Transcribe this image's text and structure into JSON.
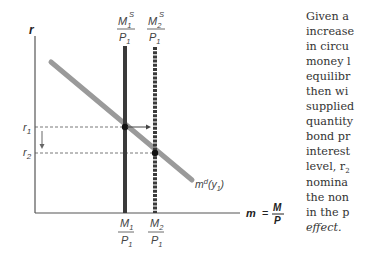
{
  "diagram": {
    "type": "money-market",
    "y_axis_label": "r",
    "x_axis_label": "m = M/P",
    "x_axis_label_parts": {
      "m": "m",
      "eq": "=",
      "num": "M",
      "den": "P"
    },
    "supply_curves": [
      {
        "name": "M1S/P1",
        "num": "M",
        "num_sub": "1",
        "num_sup": "S",
        "den": "P",
        "den_sub": "1",
        "style": "solid"
      },
      {
        "name": "M2S/P1",
        "num": "M",
        "num_sub": "2",
        "num_sup": "S",
        "den": "P",
        "den_sub": "1",
        "style": "dotted"
      }
    ],
    "bottom_labels": [
      {
        "num": "M",
        "num_sub": "1",
        "den": "P",
        "den_sub": "1"
      },
      {
        "num": "M",
        "num_sub": "2",
        "den": "P",
        "den_sub": "1"
      }
    ],
    "demand_curve": {
      "label": "m",
      "sup": "d",
      "arg": "(y",
      "arg_sub": "1",
      "close": ")"
    },
    "rate_levels": [
      {
        "label": "r",
        "sub": "1"
      },
      {
        "label": "r",
        "sub": "2"
      }
    ],
    "colors": {
      "axis": "#555555",
      "supply": "#3a3a3a",
      "demand": "#9a9a9a",
      "dash": "#555555"
    }
  },
  "text_lines": [
    "Given a",
    "increase",
    "in circu",
    "money l",
    "equilibr",
    "then wi",
    "supplied",
    "quantity",
    "bond pr",
    "interest",
    "level, r",
    "nomina",
    "the non",
    "in the p",
    "effect."
  ],
  "text_line_10_sub": "2"
}
